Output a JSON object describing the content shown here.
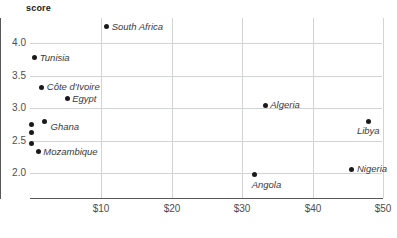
{
  "chart_data": {
    "type": "scatter",
    "title": "",
    "ylabel": "score",
    "xlabel": "",
    "xlim": [
      -0.1,
      53.0
    ],
    "ylim": [
      1.63,
      4.4
    ],
    "grid": true,
    "legend": "none",
    "x_tick_labels": [
      "$10",
      "$20",
      "$30",
      "$40",
      "$50"
    ],
    "x_tick_values": [
      10,
      20,
      30,
      40,
      50
    ],
    "y_tick_labels": [
      "4.0",
      "3.5",
      "3.0",
      "2.5",
      "2.0"
    ],
    "y_tick_values": [
      4.0,
      3.5,
      3.0,
      2.5,
      2.0
    ],
    "points": [
      {
        "label": "South Africa",
        "x": 10.8,
        "y": 4.25,
        "label_pos": "right"
      },
      {
        "label": "Tunisia",
        "x": 0.6,
        "y": 3.77,
        "label_pos": "right"
      },
      {
        "label": "Côte d'Ivoire",
        "x": 1.6,
        "y": 3.32,
        "label_pos": "right"
      },
      {
        "label": "Egypt",
        "x": 5.2,
        "y": 3.14,
        "label_pos": "right"
      },
      {
        "label": "Ghana",
        "x": 2.0,
        "y": 2.8,
        "label_pos": "right-below"
      },
      {
        "label": "",
        "x": 0.2,
        "y": 2.74,
        "label_pos": "none"
      },
      {
        "label": "",
        "x": 0.2,
        "y": 2.63,
        "label_pos": "none"
      },
      {
        "label": "",
        "x": 0.2,
        "y": 2.45,
        "label_pos": "none"
      },
      {
        "label": "Mozambique",
        "x": 1.1,
        "y": 2.33,
        "label_pos": "right"
      },
      {
        "label": "Algeria",
        "x": 33.3,
        "y": 3.04,
        "label_pos": "right"
      },
      {
        "label": "Libya",
        "x": 48.0,
        "y": 2.8,
        "label_pos": "below-left"
      },
      {
        "label": "Angola",
        "x": 31.8,
        "y": 1.97,
        "label_pos": "below-right"
      },
      {
        "label": "Nigeria",
        "x": 45.6,
        "y": 2.06,
        "label_pos": "right"
      }
    ]
  },
  "colors": {
    "point": "#1a1a1a",
    "gridline": "#d2d3d5",
    "axis": "#58585a",
    "tick_text": "#4d4d4f",
    "label_text": "#3a3a3c",
    "background": "#ffffff"
  }
}
